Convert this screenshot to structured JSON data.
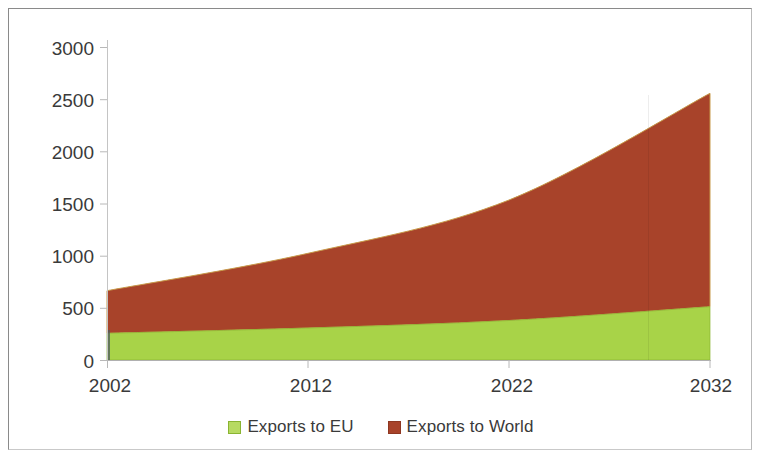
{
  "chart_data": {
    "type": "area",
    "stacked": true,
    "title": "",
    "subtitle": "",
    "xlabel": "",
    "ylabel": "",
    "x": [
      2002,
      2012,
      2022,
      2032
    ],
    "xtick_labels": [
      "2002",
      "2012",
      "2022",
      "2032"
    ],
    "xlim": [
      2002,
      2032
    ],
    "ytick_labels": [
      "0",
      "500",
      "1000",
      "1500",
      "2000",
      "2500",
      "3000"
    ],
    "yticks": [
      0,
      500,
      1000,
      1500,
      2000,
      2500,
      3000
    ],
    "ylim": [
      0,
      3000
    ],
    "grid": false,
    "legend_position": "bottom-center",
    "series": [
      {
        "name": "Exports to EU",
        "color": "#a8d348",
        "values": [
          250,
          300,
          370,
          500
        ]
      },
      {
        "name": "Exports to World",
        "color": "#a8432a",
        "values": [
          400,
          700,
          1130,
          2000
        ],
        "cumulative_top": [
          650,
          1000,
          1500,
          2500
        ]
      }
    ],
    "annotations": []
  },
  "axes": {
    "y_ticks": [
      {
        "label": "3000",
        "value": 3000
      },
      {
        "label": "2500",
        "value": 2500
      },
      {
        "label": "2000",
        "value": 2000
      },
      {
        "label": "1500",
        "value": 1500
      },
      {
        "label": "1000",
        "value": 1000
      },
      {
        "label": "500",
        "value": 500
      },
      {
        "label": "0",
        "value": 0
      }
    ],
    "x_ticks": [
      {
        "label": "2002",
        "value": 2002
      },
      {
        "label": "2012",
        "value": 2012
      },
      {
        "label": "2022",
        "value": 2022
      },
      {
        "label": "2032",
        "value": 2032
      }
    ]
  },
  "legend": {
    "entries": [
      {
        "label": "Exports to EU",
        "color": "#a8d348"
      },
      {
        "label": "Exports to World",
        "color": "#a8432a"
      }
    ]
  },
  "colors": {
    "eu_fill": "#a8d348",
    "world_fill": "#a8432a",
    "axis": "#b0b0b0",
    "text": "#3a3a3a",
    "frame": "#8a8a8a",
    "background": "#ffffff"
  }
}
